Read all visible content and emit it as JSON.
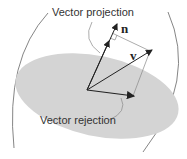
{
  "diagram": {
    "labels": {
      "projection": "Vector projection",
      "rejection": "Vector rejection",
      "n": "n",
      "v": "v"
    },
    "colors": {
      "plane": "#d4d4d4",
      "line": "#333333",
      "thin": "#888888"
    }
  }
}
